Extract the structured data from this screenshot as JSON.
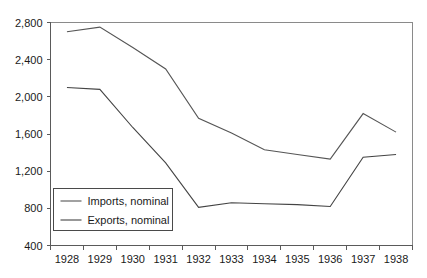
{
  "chart_data": {
    "type": "line",
    "title": "",
    "subtitle": "",
    "xlabel": "",
    "ylabel": "",
    "categories": [
      "1928",
      "1929",
      "1930",
      "1931",
      "1932",
      "1933",
      "1934",
      "1935",
      "1936",
      "1937",
      "1938"
    ],
    "x": [
      1928,
      1929,
      1930,
      1931,
      1932,
      1933,
      1934,
      1935,
      1936,
      1937,
      1938
    ],
    "series": [
      {
        "name": "Imports, nominal",
        "color": "#555555",
        "values": [
          2700,
          2750,
          2530,
          2300,
          1770,
          1610,
          1430,
          1380,
          1330,
          1820,
          1620
        ]
      },
      {
        "name": "Exports, nominal",
        "color": "#444444",
        "values": [
          2100,
          2080,
          1670,
          1290,
          810,
          860,
          850,
          840,
          820,
          1350,
          1380
        ]
      }
    ],
    "ylim": [
      400,
      2800
    ],
    "ytick_values": [
      400,
      800,
      1200,
      1600,
      2000,
      2400,
      2800
    ],
    "ytick_labels": [
      "400",
      "800",
      "1,200",
      "1,600",
      "2,000",
      "2,400",
      "2,800"
    ],
    "grid": false,
    "legend_position": "lower-left",
    "legend_entries": [
      "Imports, nominal",
      "Exports, nominal"
    ],
    "annotations": []
  },
  "legend": {
    "entries": [
      {
        "label": "Imports, nominal"
      },
      {
        "label": "Exports, nominal"
      }
    ]
  }
}
